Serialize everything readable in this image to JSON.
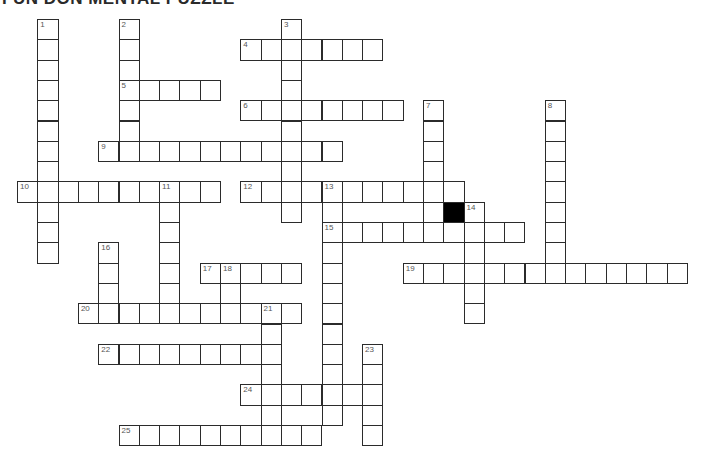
{
  "title": "FUN DON MENTAL PUZZLE",
  "grid": {
    "origin_x": 17,
    "origin_y": 19,
    "cell_size": 20.3,
    "line_color": "#2b2b2b",
    "block_color": "#000000"
  },
  "blocks": [
    {
      "col": 21,
      "row": 9
    }
  ],
  "entries": [
    {
      "number": "1",
      "direction": "down",
      "col": 1,
      "row": 0,
      "length": 12
    },
    {
      "number": "2",
      "direction": "down",
      "col": 5,
      "row": 0,
      "length": 7
    },
    {
      "number": "3",
      "direction": "down",
      "col": 13,
      "row": 0,
      "length": 10
    },
    {
      "number": "4",
      "direction": "across",
      "col": 11,
      "row": 1,
      "length": 7
    },
    {
      "number": "5",
      "direction": "across",
      "col": 5,
      "row": 3,
      "length": 5
    },
    {
      "number": "6",
      "direction": "across",
      "col": 11,
      "row": 4,
      "length": 8
    },
    {
      "number": "7",
      "direction": "down",
      "col": 20,
      "row": 4,
      "length": 7
    },
    {
      "number": "8",
      "direction": "down",
      "col": 26,
      "row": 4,
      "length": 9
    },
    {
      "number": "9",
      "direction": "across",
      "col": 4,
      "row": 6,
      "length": 12
    },
    {
      "number": "10",
      "direction": "across",
      "col": 0,
      "row": 8,
      "length": 10
    },
    {
      "number": "11",
      "direction": "down",
      "col": 7,
      "row": 8,
      "length": 7
    },
    {
      "number": "12",
      "direction": "across",
      "col": 11,
      "row": 8,
      "length": 11
    },
    {
      "number": "13",
      "direction": "down",
      "col": 15,
      "row": 8,
      "length": 12
    },
    {
      "number": "14",
      "direction": "down",
      "col": 22,
      "row": 9,
      "length": 6
    },
    {
      "number": "15",
      "direction": "across",
      "col": 15,
      "row": 10,
      "length": 10
    },
    {
      "number": "16",
      "direction": "down",
      "col": 4,
      "row": 11,
      "length": 4
    },
    {
      "number": "17",
      "direction": "across",
      "col": 9,
      "row": 12,
      "length": 5
    },
    {
      "number": "18",
      "direction": "down",
      "col": 10,
      "row": 12,
      "length": 3
    },
    {
      "number": "19",
      "direction": "across",
      "col": 19,
      "row": 12,
      "length": 14
    },
    {
      "number": "20",
      "direction": "across",
      "col": 3,
      "row": 14,
      "length": 11
    },
    {
      "number": "21",
      "direction": "down",
      "col": 12,
      "row": 14,
      "length": 7
    },
    {
      "number": "22",
      "direction": "across",
      "col": 4,
      "row": 16,
      "length": 9
    },
    {
      "number": "23",
      "direction": "down",
      "col": 17,
      "row": 16,
      "length": 5
    },
    {
      "number": "24",
      "direction": "across",
      "col": 11,
      "row": 18,
      "length": 7
    },
    {
      "number": "25",
      "direction": "across",
      "col": 5,
      "row": 20,
      "length": 10
    }
  ]
}
